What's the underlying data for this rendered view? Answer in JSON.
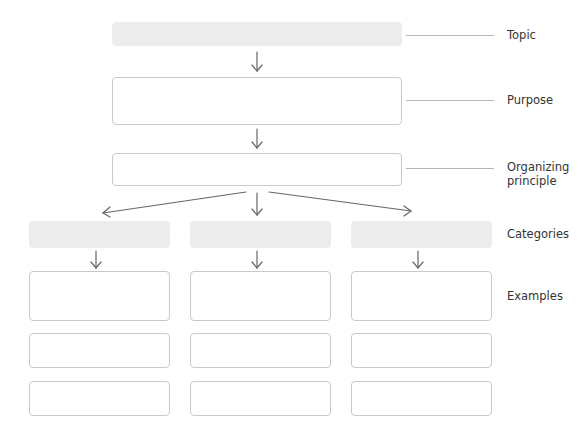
{
  "labels": {
    "topic": "Topic",
    "purpose": "Purpose",
    "organizing_line1": "Organizing",
    "organizing_line2": "principle",
    "categories": "Categories",
    "examples": "Examples"
  },
  "boxes": {
    "topic": "",
    "purpose": "",
    "organizing_principle": "",
    "categories": [
      "",
      "",
      ""
    ],
    "examples": [
      [
        "",
        "",
        ""
      ],
      [
        "",
        "",
        ""
      ],
      [
        "",
        "",
        ""
      ]
    ]
  },
  "colors": {
    "filled_box": "#ececec",
    "outline": "#c9c9c9",
    "arrow": "#666666"
  }
}
